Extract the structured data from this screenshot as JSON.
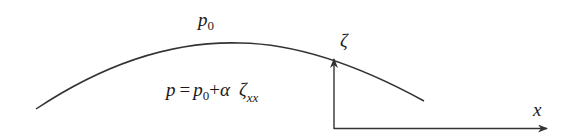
{
  "diagram": {
    "labels": {
      "p0_above": {
        "base": "p",
        "sub": "0"
      },
      "equation": {
        "lhs": "p",
        "eq": "=",
        "p": "p",
        "p_sub": "0",
        "plus": "+",
        "alpha": "α",
        "zeta": "ζ",
        "zeta_sub": "xx"
      },
      "zeta_axis": "ζ",
      "x_axis": "x"
    },
    "colors": {
      "stroke": "#333333",
      "text": "#1a1a1a",
      "background": "#ffffff"
    },
    "elements": {
      "surface_curve": "free surface curve",
      "vertical_axis": "zeta axis arrow",
      "horizontal_axis": "x axis arrow"
    }
  }
}
